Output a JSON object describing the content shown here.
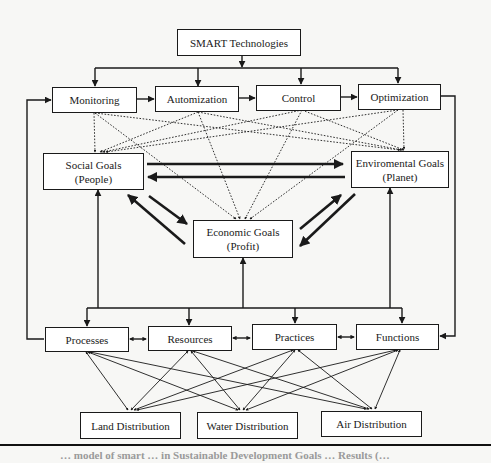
{
  "diagram": {
    "top": {
      "label": "SMART Technologies"
    },
    "technologies": [
      {
        "label": "Monitoring"
      },
      {
        "label": "Automization"
      },
      {
        "label": "Control"
      },
      {
        "label": "Optimization"
      }
    ],
    "goals": {
      "social": {
        "line1": "Social Goals",
        "line2": "(People)"
      },
      "environmental": {
        "line1": "Enviromental Goals",
        "line2": "(Planet)"
      },
      "economic": {
        "line1": "Economic Goals",
        "line2": "(Profit)"
      }
    },
    "elements": [
      {
        "label": "Processes"
      },
      {
        "label": "Resources"
      },
      {
        "label": "Practices"
      },
      {
        "label": "Functions"
      }
    ],
    "distributions": [
      {
        "label": "Land Distribution"
      },
      {
        "label": "Water Distribution"
      },
      {
        "label": "Air Distribution"
      }
    ]
  },
  "caption": {
    "text": "… model of smart … in Sustainable Development Goals … Results (…"
  },
  "colors": {
    "line": "#1a1a1a",
    "box_bg": "#ffffff",
    "page_bg": "#f7f7f5"
  }
}
